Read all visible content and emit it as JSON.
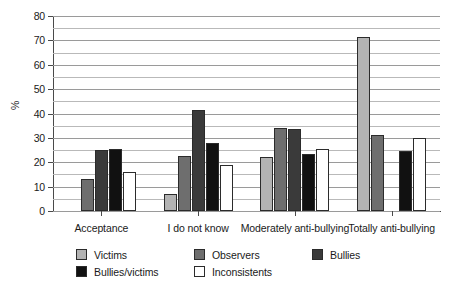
{
  "chart_data": {
    "type": "bar",
    "title": "",
    "xlabel": "",
    "ylabel": "%",
    "ylim": [
      0,
      80
    ],
    "ytick_step": 10,
    "minor_gridline_step": 5,
    "grid": true,
    "legend_position": "bottom",
    "categories": [
      "Acceptance",
      "I do not know",
      "Moderately anti-bullying",
      "Totally anti-bullying"
    ],
    "yticks": [
      "0",
      "10",
      "20",
      "30",
      "40",
      "50",
      "60",
      "70",
      "80"
    ],
    "series": [
      {
        "name": "Victims",
        "color": "#b3b3b3",
        "values": [
          0,
          7,
          22,
          71.5
        ]
      },
      {
        "name": "Observers",
        "color": "#6e6e6e",
        "values": [
          13,
          22.5,
          34,
          31
        ]
      },
      {
        "name": "Bullies",
        "color": "#3a3a3a",
        "values": [
          25,
          41.5,
          33.5,
          0
        ]
      },
      {
        "name": "Bullies/victims",
        "color": "#111111",
        "values": [
          25.5,
          28,
          23.5,
          24.5
        ]
      },
      {
        "name": "Inconsistents",
        "color": "#ffffff",
        "values": [
          16,
          19,
          25.5,
          30
        ]
      }
    ]
  }
}
